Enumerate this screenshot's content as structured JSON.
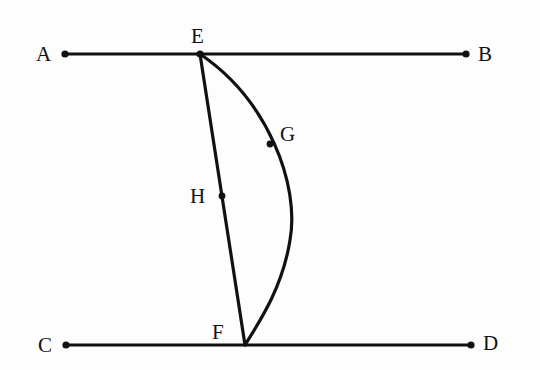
{
  "diagram": {
    "type": "geometry",
    "colors": {
      "stroke": "#111111",
      "background": "#fdfdfd"
    },
    "points": {
      "A": {
        "label": "A",
        "x": 65,
        "y": 54
      },
      "B": {
        "label": "B",
        "x": 466,
        "y": 54
      },
      "C": {
        "label": "C",
        "x": 66,
        "y": 345
      },
      "D": {
        "label": "D",
        "x": 471,
        "y": 345
      },
      "E": {
        "label": "E",
        "x": 200,
        "y": 54
      },
      "F": {
        "label": "F",
        "x": 245,
        "y": 345
      },
      "G": {
        "label": "G",
        "x": 270,
        "y": 144
      },
      "H": {
        "label": "H",
        "x": 222,
        "y": 196
      }
    },
    "segments": [
      "AB",
      "CD",
      "EF"
    ],
    "arcs": [
      {
        "from": "E",
        "to": "F",
        "through": "G"
      }
    ]
  }
}
